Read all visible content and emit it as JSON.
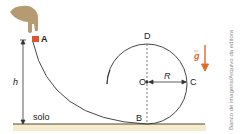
{
  "figure": {
    "points": {
      "A": "A",
      "B": "B",
      "C": "C",
      "D": "D",
      "O": "O"
    },
    "labels": {
      "height": "h",
      "radius": "R",
      "ground": "solo",
      "gravity": "g"
    },
    "credit": "Banco de imagens/Arquivo da editora",
    "colors": {
      "block": "#d9542f",
      "gravity_vector": "#e06a2a",
      "ground_band": "#f6eccb",
      "ground_line": "#4a4a3a",
      "curve": "#333333",
      "hand": "#b59a72"
    }
  }
}
